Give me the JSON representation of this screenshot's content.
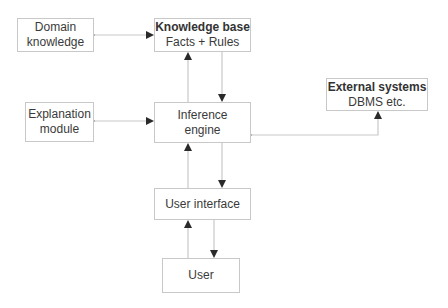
{
  "diagram": {
    "nodes": {
      "domain_knowledge": {
        "line1": "Domain",
        "line2": "knowledge"
      },
      "knowledge_base": {
        "title": "Knowledge base",
        "subtitle": "Facts + Rules"
      },
      "explanation_module": {
        "line1": "Explanation",
        "line2": "module"
      },
      "inference_engine": {
        "line1": "Inference",
        "line2": "engine"
      },
      "external_systems": {
        "title": "External systems",
        "subtitle": "DBMS etc."
      },
      "user_interface": {
        "label": "User interface"
      },
      "user": {
        "label": "User"
      }
    },
    "edges": [
      {
        "from": "Domain knowledge",
        "to": "Knowledge base",
        "direction": "bidirectional"
      },
      {
        "from": "Inference engine",
        "to": "Knowledge base",
        "direction": "forward"
      },
      {
        "from": "Knowledge base",
        "to": "Inference engine",
        "direction": "forward"
      },
      {
        "from": "Explanation module",
        "to": "Inference engine",
        "direction": "bidirectional"
      },
      {
        "from": "External systems",
        "to": "Inference engine",
        "direction": "bidirectional"
      },
      {
        "from": "User interface",
        "to": "Inference engine",
        "direction": "forward"
      },
      {
        "from": "Inference engine",
        "to": "User interface",
        "direction": "forward"
      },
      {
        "from": "User",
        "to": "User interface",
        "direction": "forward"
      },
      {
        "from": "User interface",
        "to": "User",
        "direction": "forward"
      }
    ],
    "colors": {
      "line": "#c8c8c8",
      "arrowhead": "#2a2a2a",
      "text": "#3a3a3a"
    }
  }
}
